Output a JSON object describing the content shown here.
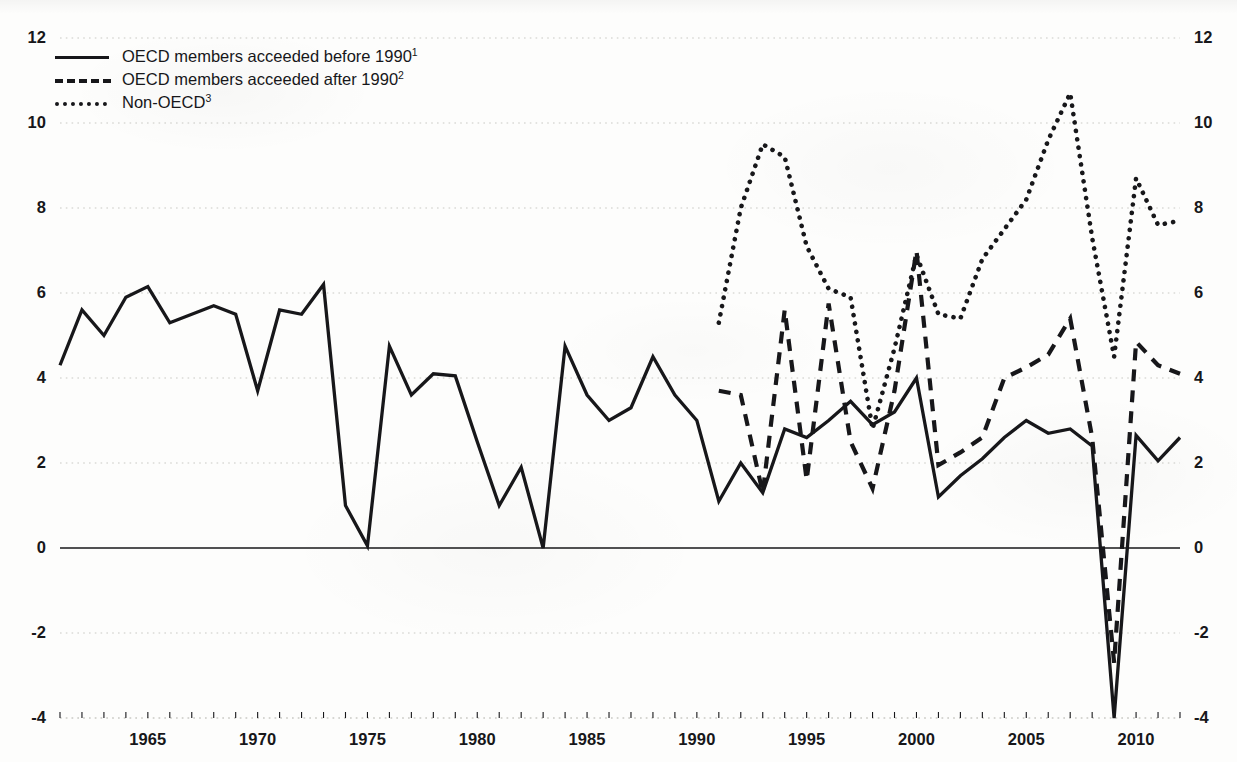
{
  "chart_data": {
    "type": "line",
    "title": "",
    "subtitle": "",
    "xlabel": "",
    "ylabel": "",
    "xlim": [
      1961,
      2012
    ],
    "ylim": [
      -4,
      12
    ],
    "grid": true,
    "grid_axis": "y",
    "legend_position": "top-left",
    "dual_y_axis": true,
    "y_ticks": [
      12,
      10,
      8,
      6,
      4,
      2,
      0,
      -2,
      -4
    ],
    "y_tick_labels": [
      "12",
      "10",
      "8",
      "6",
      "4",
      "2",
      "0",
      "-2",
      "-4"
    ],
    "x_ticks": [
      1965,
      1970,
      1975,
      1980,
      1985,
      1990,
      1995,
      2000,
      2005,
      2010
    ],
    "x_tick_labels": [
      "1965",
      "1970",
      "1975",
      "1980",
      "1985",
      "1990",
      "1995",
      "2000",
      "2005",
      "2010"
    ],
    "x_minor_tick_interval": 1,
    "zero_line": 0,
    "colors": {
      "line": "#17171a",
      "grid": "#c9c9c4",
      "axis": "#17171a",
      "background": "#fdfdfc"
    },
    "series": [
      {
        "name": "OECD members acceeded before 1990",
        "footnote": "1",
        "style": "solid",
        "x": [
          1961,
          1962,
          1963,
          1964,
          1965,
          1966,
          1967,
          1968,
          1969,
          1970,
          1971,
          1972,
          1973,
          1974,
          1975,
          1976,
          1977,
          1978,
          1979,
          1980,
          1981,
          1982,
          1983,
          1984,
          1985,
          1986,
          1987,
          1988,
          1989,
          1990,
          1991,
          1992,
          1993,
          1994,
          1995,
          1996,
          1997,
          1998,
          1999,
          2000,
          2001,
          2002,
          2003,
          2004,
          2005,
          2006,
          2007,
          2008,
          2009,
          2010,
          2011,
          2012
        ],
        "values": [
          4.3,
          5.6,
          5.0,
          5.9,
          6.15,
          5.3,
          5.5,
          5.7,
          5.5,
          3.7,
          5.6,
          5.5,
          6.2,
          1.0,
          0.05,
          4.75,
          3.6,
          4.1,
          4.05,
          2.5,
          1.0,
          1.9,
          0.0,
          4.75,
          3.6,
          3.0,
          3.3,
          4.5,
          3.6,
          3.0,
          1.1,
          2.0,
          1.3,
          2.8,
          2.6,
          3.0,
          3.45,
          2.9,
          3.2,
          4.0,
          1.2,
          1.7,
          2.1,
          2.6,
          3.0,
          2.7,
          2.8,
          2.4,
          -4.0,
          2.65,
          2.05,
          2.6
        ]
      },
      {
        "name": "OECD members acceeded after 1990",
        "footnote": "2",
        "style": "dashed",
        "x": [
          1991,
          1992,
          1993,
          1994,
          1995,
          1996,
          1997,
          1998,
          1999,
          2000,
          2001,
          2002,
          2003,
          2004,
          2005,
          2006,
          2007,
          2008,
          2009,
          2010,
          2011,
          2012
        ],
        "values": [
          3.7,
          3.6,
          1.3,
          5.6,
          1.6,
          5.75,
          2.5,
          1.4,
          3.7,
          7.0,
          1.95,
          2.25,
          2.6,
          4.0,
          4.25,
          4.55,
          5.4,
          2.6,
          -2.7,
          4.85,
          4.3,
          4.1
        ]
      },
      {
        "name": "Non-OECD",
        "footnote": "3",
        "style": "dotted",
        "x": [
          1991,
          1992,
          1993,
          1994,
          1995,
          1996,
          1997,
          1998,
          1999,
          2000,
          2001,
          2002,
          2003,
          2004,
          2005,
          2006,
          2007,
          2008,
          2009,
          2010,
          2011,
          2012
        ],
        "values": [
          5.3,
          8.0,
          9.5,
          9.2,
          7.1,
          6.1,
          5.9,
          2.8,
          4.7,
          6.9,
          5.5,
          5.4,
          6.8,
          7.5,
          8.2,
          9.6,
          10.7,
          7.3,
          4.5,
          8.7,
          7.6,
          7.7
        ]
      }
    ]
  },
  "legend": {
    "items": [
      {
        "label": "OECD members acceeded before 1990",
        "footnote": "1",
        "style": "solid"
      },
      {
        "label": "OECD members acceeded after 1990",
        "footnote": "2",
        "style": "dashed"
      },
      {
        "label": "Non-OECD",
        "footnote": "3",
        "style": "dotted"
      }
    ]
  },
  "axes": {
    "left_labels": [
      "12",
      "10",
      "8",
      "6",
      "4",
      "2",
      "0",
      "-2",
      "-4"
    ],
    "right_labels": [
      "12",
      "10",
      "8",
      "6",
      "4",
      "2",
      "0",
      "-2",
      "-4"
    ],
    "bottom_labels": [
      "1965",
      "1970",
      "1975",
      "1980",
      "1985",
      "1990",
      "1995",
      "2000",
      "2005",
      "2010"
    ]
  }
}
